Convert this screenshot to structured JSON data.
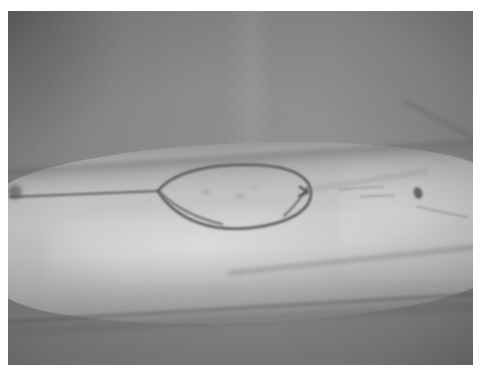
{
  "image": {
    "kind": "photograph",
    "subject": "clinical photograph of a limb with a surgical skin marking",
    "color_mode": "grayscale",
    "width_px": 483,
    "height_px": 377,
    "border": {
      "color": "#ffffff",
      "left_px": 8,
      "top_px": 11,
      "right_px": 10,
      "bottom_px": 12
    },
    "palette": {
      "photo_background_gray": "#8b8b8b",
      "backdrop_dark_gray": "#7e7e7e",
      "skin_midtone_gray": "#b4b4b4",
      "skin_highlight_gray": "#cccccc",
      "marking_ink_gray": "#5a5a5a",
      "shadow_gray": "#6e6e6e",
      "border_white": "#ffffff"
    },
    "alt_text": "Grayscale photograph of a human forearm lying horizontally across the frame. An elongated oval (fusiform) outline is drawn on the skin near the centre of the limb, with a straight horizontal guideline running from the left edge of the picture to the left apex of the oval. A small dark mole sits on the skin to the right of the oval."
  },
  "features": [
    {
      "id": "limb",
      "name": "forearm",
      "description": "Pale limb crossing the frame horizontally, brighter than the backdrop, slightly tilted downward to the left."
    },
    {
      "id": "surgical-ellipse",
      "name": "fusiform skin marking",
      "description": "Ink ellipse drawn on the skin with pointed left and right apices and a faint second inner line near each end.",
      "center_px": [
        233,
        190
      ],
      "width_px": 150,
      "height_px": 52
    },
    {
      "id": "guide-line",
      "name": "horizontal guide line",
      "description": "Straight ink line running from the left picture edge to the left apex of the ellipse.",
      "y_px": 193
    },
    {
      "id": "mole",
      "name": "pigmented lesion",
      "description": "Small dark spot on the skin to the right of the marking.",
      "center_px": [
        418,
        193
      ]
    },
    {
      "id": "skin-fold-lower",
      "name": "lower skin fold",
      "description": "Soft dark crease defining the underside contour of the limb."
    },
    {
      "id": "skin-fold-upper",
      "name": "upper limb contour",
      "description": "Shadowed edge along the top of the limb separating it from the grey backdrop."
    },
    {
      "id": "edge-blob",
      "name": "dark artefact at left edge",
      "description": "Small blurred dark mark at the left border of the photograph."
    },
    {
      "id": "backdrop-seam",
      "name": "backdrop seam",
      "description": "Faint vertical tonal seam in the grey backdrop behind the limb."
    }
  ]
}
